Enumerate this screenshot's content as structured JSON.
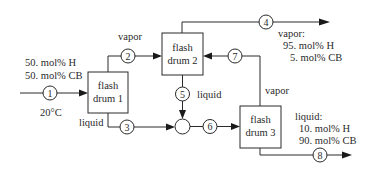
{
  "diagram": {
    "type": "process-flow",
    "units": [
      {
        "id": "drum1",
        "line1": "flash",
        "line2": "drum 1"
      },
      {
        "id": "drum2",
        "line1": "flash",
        "line2": "drum 2"
      },
      {
        "id": "drum3",
        "line1": "flash",
        "line2": "drum 3"
      }
    ],
    "streams": [
      {
        "id": "1",
        "label": "1"
      },
      {
        "id": "2",
        "label": "2"
      },
      {
        "id": "3",
        "label": "3"
      },
      {
        "id": "4",
        "label": "4"
      },
      {
        "id": "5",
        "label": "5"
      },
      {
        "id": "6",
        "label": "6"
      },
      {
        "id": "7",
        "label": "7"
      },
      {
        "id": "8",
        "label": "8"
      }
    ],
    "feed": {
      "comp1": "50. mol% H",
      "comp2": "50. mol% CB",
      "temperature": "20°C"
    },
    "labels": {
      "drum1_vapor": "vapor",
      "drum1_liquid": "liquid",
      "drum2_liquid": "liquid",
      "drum3_vapor": "vapor"
    },
    "product_vapor": {
      "title": "vapor:",
      "comp1": "95. mol% H",
      "comp2": "5. mol% CB"
    },
    "product_liquid": {
      "title": "liquid:",
      "comp1": "10. mol% H",
      "comp2": "90. mol% CB"
    }
  }
}
